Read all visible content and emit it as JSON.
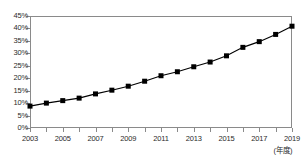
{
  "chart_data": {
    "type": "line",
    "title": "",
    "subtitle": "",
    "xlabel": "(年度)",
    "ylabel": "",
    "grid": false,
    "legend": null,
    "legend_position": "none",
    "marker": "square",
    "marker_color": "#000000",
    "line_color": "#000000",
    "x": [
      2003,
      2004,
      2005,
      2006,
      2007,
      2008,
      2009,
      2010,
      2011,
      2012,
      2013,
      2014,
      2015,
      2016,
      2017,
      2018,
      2019
    ],
    "values": [
      8.8,
      10.0,
      11.0,
      12.0,
      13.7,
      15.2,
      16.8,
      18.8,
      21.0,
      22.6,
      24.6,
      26.5,
      29.0,
      32.4,
      34.7,
      37.6,
      40.9
    ],
    "categories": [
      "2003",
      "2004",
      "2005",
      "2006",
      "2007",
      "2008",
      "2009",
      "2010",
      "2011",
      "2012",
      "2013",
      "2014",
      "2015",
      "2016",
      "2017",
      "2018",
      "2019"
    ],
    "xlim": [
      2003,
      2019
    ],
    "ylim": [
      0,
      45
    ],
    "y_ticks": [
      0,
      5,
      10,
      15,
      20,
      25,
      30,
      35,
      40,
      45
    ],
    "y_tick_labels": [
      "0%",
      "5%",
      "10%",
      "15%",
      "20%",
      "25%",
      "30%",
      "35%",
      "40%",
      "45%"
    ],
    "x_tick_labels": [
      "2003",
      "2005",
      "2007",
      "2009",
      "2011",
      "2013",
      "2015",
      "2017",
      "2019"
    ],
    "x_tick_years": [
      2003,
      2005,
      2007,
      2009,
      2011,
      2013,
      2015,
      2017,
      2019
    ]
  },
  "colors": {
    "axis": "#8a8a8a",
    "text": "#2b2b2b",
    "series": "#000000",
    "background": "#ffffff"
  }
}
